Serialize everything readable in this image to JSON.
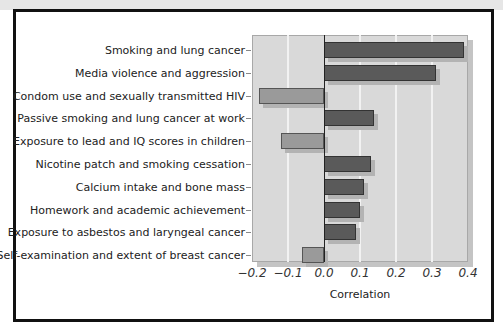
{
  "chart_data": {
    "type": "bar",
    "orientation": "horizontal",
    "title": "",
    "xlabel": "Correlation",
    "ylabel": "",
    "xlim": [
      -0.2,
      0.4
    ],
    "xticks": [
      "−0.2",
      "−0.1",
      "0.0",
      "0.1",
      "0.2",
      "0.3",
      "0.4"
    ],
    "grid": true,
    "legend": null,
    "categories": [
      "Smoking and lung cancer",
      "Media violence and aggression",
      "Condom use and sexually transmitted HIV",
      "Passive smoking and lung cancer at work",
      "Exposure to lead and IQ scores in children",
      "Nicotine patch and smoking cessation",
      "Calcium intake and bone mass",
      "Homework and academic achievement",
      "Exposure to asbestos and laryngeal cancer",
      "Self-examination and extent of breast cancer"
    ],
    "values": [
      0.39,
      0.31,
      -0.18,
      0.14,
      -0.12,
      0.13,
      0.11,
      0.1,
      0.09,
      -0.06
    ]
  },
  "colors": {
    "positive_bar": "#5a5a5a",
    "negative_bar": "#9a9a9a",
    "plot_background": "#d9d9d9",
    "gridline": "#f2f2f2",
    "frame": "#111111"
  }
}
